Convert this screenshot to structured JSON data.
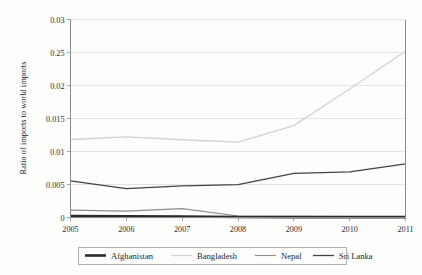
{
  "chart_data": {
    "type": "line",
    "title": "",
    "xlabel": "",
    "ylabel": "Ratio of imports to world imports",
    "categories": [
      "2005",
      "2006",
      "2007",
      "2008",
      "2009",
      "2010",
      "2011"
    ],
    "x": [
      2005,
      2006,
      2007,
      2008,
      2009,
      2010,
      2011
    ],
    "xlim": [
      2005,
      2011
    ],
    "ylim": [
      0,
      0.03
    ],
    "grid": true,
    "legend_position": "bottom",
    "y_tick_values": [
      0,
      0.005,
      0.01,
      0.015,
      0.02,
      0.025,
      0.03
    ],
    "y_tick_labels": [
      "0",
      "0.005",
      "0.01",
      "0.015",
      "0.02",
      "0.25",
      "0.03"
    ],
    "x_tick_labels": [
      "2005",
      "2006",
      "2007",
      "2008",
      "2009",
      "2010",
      "2011"
    ],
    "series": [
      {
        "name": "Afghanistan",
        "color": "#2b2b2b",
        "width": 2.6,
        "values": [
          0.00022,
          0.00018,
          0.00016,
          8e-05,
          5e-05,
          4e-05,
          3e-05
        ]
      },
      {
        "name": "Bangladesh",
        "color": "#d2d2d2",
        "width": 1.3,
        "values": [
          0.01182,
          0.01222,
          0.01178,
          0.01142,
          0.01392,
          0.01948,
          0.02518
        ]
      },
      {
        "name": "Nepal",
        "color": "#8d8d8d",
        "width": 1.1,
        "values": [
          0.00112,
          0.00096,
          0.00134,
          0.00022,
          0.0002,
          0.00021,
          0.00023
        ]
      },
      {
        "name": "Sri Lanka",
        "color": "#434343",
        "width": 1.3,
        "values": [
          0.00556,
          0.00436,
          0.00478,
          0.00498,
          0.00668,
          0.00692,
          0.00812
        ]
      }
    ]
  },
  "legend": {
    "entries": [
      {
        "label": "Afghanistan"
      },
      {
        "label": "Bangladesh"
      },
      {
        "label": "Nepal"
      },
      {
        "label": "Sri Lanka"
      }
    ]
  }
}
